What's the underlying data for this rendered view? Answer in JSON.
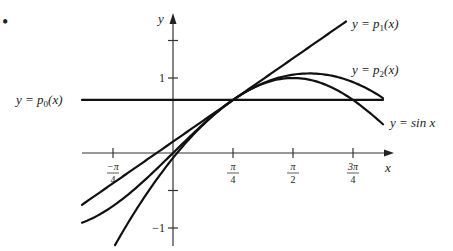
{
  "figure": {
    "bullet": "•",
    "axes": {
      "x_label": "x",
      "y_label": "y",
      "x_ticks": [
        {
          "num": "−π",
          "den": "4",
          "value": -0.7854
        },
        {
          "num": "π",
          "den": "4",
          "value": 0.7854
        },
        {
          "num": "π",
          "den": "2",
          "value": 1.5708
        },
        {
          "num": "3π",
          "den": "4",
          "value": 2.3562
        }
      ],
      "y_ticks": [
        {
          "label": "",
          "value": 1.5
        },
        {
          "label": "1",
          "value": 1
        },
        {
          "label": "",
          "value": -0.5
        },
        {
          "label": "−1",
          "value": -1
        }
      ]
    },
    "curves": [
      {
        "name": "p0",
        "label_lhs": "y = ",
        "label_fn": "p",
        "label_sub": "0",
        "label_arg": "(x)",
        "formula": "√2/2"
      },
      {
        "name": "p1",
        "label_lhs": "y = ",
        "label_fn": "p",
        "label_sub": "1",
        "label_arg": "(x)",
        "formula": "√2/2 + √2/2 (x − π/4)"
      },
      {
        "name": "p2",
        "label_lhs": "y = ",
        "label_fn": "p",
        "label_sub": "2",
        "label_arg": "(x)",
        "formula": "√2/2 + √2/2 (x − π/4) − √2/4 (x − π/4)²"
      },
      {
        "name": "sin",
        "label_text": "y = sin x",
        "formula": "sin x"
      }
    ]
  },
  "chart_data": {
    "type": "line",
    "title": "",
    "xlabel": "x",
    "ylabel": "y",
    "xlim": [
      -1.18,
      2.75
    ],
    "ylim": [
      -1.2,
      1.85
    ],
    "x_tick_labels": [
      "−π/4",
      "π/4",
      "π/2",
      "3π/4"
    ],
    "y_tick_labels": [
      "1",
      "−1"
    ],
    "grid": false,
    "series": [
      {
        "name": "y = p0(x)",
        "fn": "0.7071"
      },
      {
        "name": "y = p1(x)",
        "fn": "0.7071 + 0.7071*(x - 0.7854)"
      },
      {
        "name": "y = p2(x)",
        "fn": "0.7071 + 0.7071*(x - 0.7854) - 0.35355*(x - 0.7854)^2"
      },
      {
        "name": "y = sin x",
        "fn": "sin(x)"
      }
    ],
    "annotations": [
      "Taylor polynomials of sin x centered at π/4"
    ]
  }
}
